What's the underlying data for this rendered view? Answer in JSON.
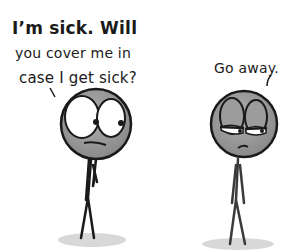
{
  "comic": {
    "left_character": {
      "speech_lines": [
        "I’m sick. Will",
        "you cover me in",
        "case I get sick?"
      ],
      "expression": "worried"
    },
    "right_character": {
      "speech": "Go away.",
      "expression": "annoyed"
    },
    "colors": {
      "ink": "#1a1a1a",
      "head_fill": "#9a9a9a",
      "eye_white": "#ffffff",
      "shadow": "#d8d8d8",
      "background": "#ffffff"
    }
  }
}
